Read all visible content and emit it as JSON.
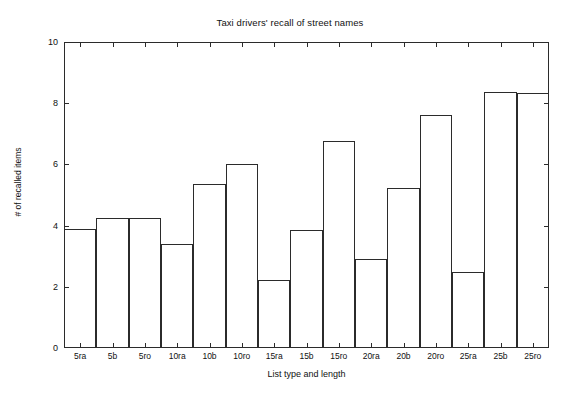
{
  "chart_data": {
    "type": "bar",
    "title": "Taxi drivers' recall of street names",
    "xlabel": "List type and length",
    "ylabel": "# of recalled items",
    "categories": [
      "5ra",
      "5b",
      "5ro",
      "10ra",
      "10b",
      "10ro",
      "15ra",
      "15b",
      "15ro",
      "20ra",
      "20b",
      "20ro",
      "25ra",
      "25b",
      "25ro"
    ],
    "values": [
      3.89,
      4.25,
      4.25,
      3.4,
      5.36,
      6.01,
      2.22,
      3.86,
      6.76,
      2.91,
      5.23,
      7.61,
      2.48,
      8.37,
      8.33
    ],
    "ylim": [
      0,
      10
    ],
    "yticks": [
      0,
      2,
      4,
      6,
      8,
      10
    ],
    "ytick_labels": [
      "0",
      "2",
      "4",
      "6",
      "8",
      "10"
    ],
    "grid": false,
    "legend": false,
    "bar_fill": "none",
    "bar_edge_color": "#2b2b2b",
    "background_color": "#ffffff"
  }
}
